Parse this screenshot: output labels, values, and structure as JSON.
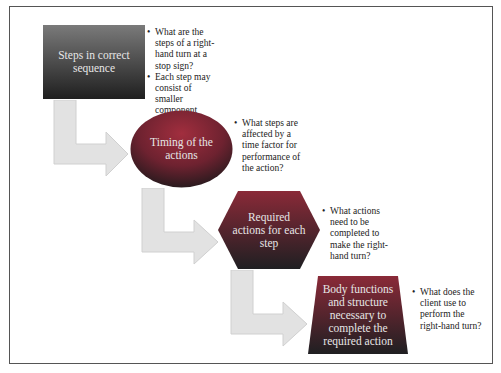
{
  "diagram": {
    "type": "step-down process flow",
    "steps": [
      {
        "shape": "rectangle",
        "label": "Steps in correct sequence",
        "bullets": [
          "What are the steps of a right-hand turn at a stop sign?",
          "Each step may consist of smaller component steps."
        ]
      },
      {
        "shape": "ellipse",
        "label": "Timing of the actions",
        "bullets": [
          "What steps are affected by a time factor for performance of the action?"
        ]
      },
      {
        "shape": "hexagon",
        "label": "Required actions for each step",
        "bullets": [
          "What actions need to be completed to make the right-hand turn?"
        ]
      },
      {
        "shape": "trapezoid",
        "label": "Body functions and structure necessary to complete the required action",
        "bullets": [
          "What does the client use to perform the right-hand turn?"
        ]
      }
    ],
    "colors": {
      "shape_top": "#7a7a7a",
      "shape_bottom": "#1f1f1f",
      "ellipse_top": "#9a2c3a",
      "ellipse_bottom": "#2a1a1e",
      "arrow": "#e0e0e0",
      "text_on_shape": "#e6e6e6",
      "bullet_text": "#222222"
    }
  }
}
